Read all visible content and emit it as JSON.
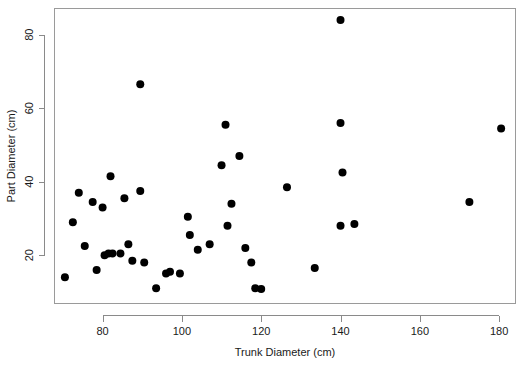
{
  "chart_data": {
    "type": "scatter",
    "title": "",
    "xlabel": "Trunk Diameter (cm)",
    "ylabel": "Part Diameter (cm)",
    "xlim": [
      68,
      184
    ],
    "ylim": [
      7,
      87
    ],
    "xticks": [
      80,
      100,
      120,
      140,
      160,
      180
    ],
    "xtick_labels": [
      "80",
      "100",
      "120",
      "140",
      "160",
      "180"
    ],
    "yticks": [
      20,
      40,
      60,
      80
    ],
    "ytick_labels": [
      "20",
      "40",
      "60",
      "80"
    ],
    "grid": false,
    "legend": false,
    "marker": "filled-circle",
    "marker_color": "#000000",
    "marker_size": 4,
    "n_points": 44,
    "points": [
      {
        "x": 70.5,
        "y": 14.0
      },
      {
        "x": 72.5,
        "y": 29.0
      },
      {
        "x": 74.0,
        "y": 37.0
      },
      {
        "x": 75.5,
        "y": 22.5
      },
      {
        "x": 77.5,
        "y": 34.5
      },
      {
        "x": 78.5,
        "y": 16.0
      },
      {
        "x": 80.0,
        "y": 33.0
      },
      {
        "x": 80.5,
        "y": 20.0
      },
      {
        "x": 81.5,
        "y": 20.5
      },
      {
        "x": 82.0,
        "y": 41.5
      },
      {
        "x": 82.5,
        "y": 20.5
      },
      {
        "x": 85.5,
        "y": 35.5
      },
      {
        "x": 86.5,
        "y": 23.0
      },
      {
        "x": 87.5,
        "y": 18.5
      },
      {
        "x": 89.5,
        "y": 66.5
      },
      {
        "x": 89.5,
        "y": 37.5
      },
      {
        "x": 93.5,
        "y": 11.0
      },
      {
        "x": 97.0,
        "y": 15.5
      },
      {
        "x": 99.5,
        "y": 15.0
      },
      {
        "x": 101.5,
        "y": 30.5
      },
      {
        "x": 102.0,
        "y": 25.5
      },
      {
        "x": 104.0,
        "y": 21.5
      },
      {
        "x": 107.0,
        "y": 23.0
      },
      {
        "x": 110.0,
        "y": 44.5
      },
      {
        "x": 111.0,
        "y": 55.5
      },
      {
        "x": 111.5,
        "y": 28.0
      },
      {
        "x": 112.5,
        "y": 34.0
      },
      {
        "x": 114.5,
        "y": 47.0
      },
      {
        "x": 116.0,
        "y": 22.0
      },
      {
        "x": 117.5,
        "y": 18.0
      },
      {
        "x": 118.5,
        "y": 11.0
      },
      {
        "x": 126.5,
        "y": 38.5
      },
      {
        "x": 133.5,
        "y": 16.5
      },
      {
        "x": 140.0,
        "y": 84.0
      },
      {
        "x": 140.0,
        "y": 56.0
      },
      {
        "x": 140.5,
        "y": 42.5
      },
      {
        "x": 140.0,
        "y": 28.0
      },
      {
        "x": 143.5,
        "y": 28.5
      },
      {
        "x": 172.5,
        "y": 34.5
      },
      {
        "x": 180.5,
        "y": 54.5
      },
      {
        "x": 84.5,
        "y": 20.5
      },
      {
        "x": 90.5,
        "y": 18.0
      },
      {
        "x": 96.0,
        "y": 15.0
      },
      {
        "x": 120.0,
        "y": 10.8
      }
    ]
  },
  "axes": {
    "x_title": "Trunk Diameter (cm)",
    "y_title": "Part Diameter (cm)"
  }
}
